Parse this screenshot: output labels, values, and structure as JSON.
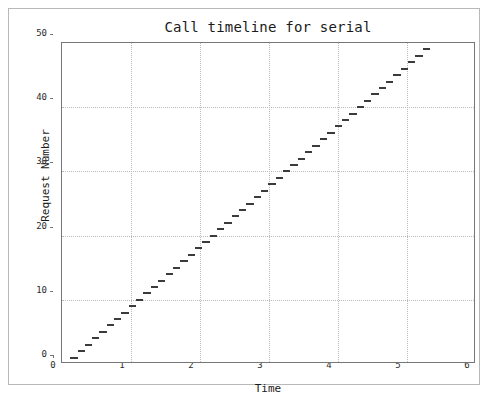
{
  "chart_data": {
    "type": "bar",
    "orientation": "horizontal-broken-barh",
    "title": "Call timeline for serial",
    "xlabel": "Time",
    "ylabel": "Request Number",
    "xlim": [
      0,
      6
    ],
    "ylim": [
      0,
      50
    ],
    "xticks": [
      0,
      1,
      2,
      3,
      4,
      5,
      6
    ],
    "yticks": [
      0,
      10,
      20,
      30,
      40,
      50
    ],
    "xtick_labels": [
      "0",
      "1",
      "2",
      "3",
      "4",
      "5",
      "6"
    ],
    "ytick_labels": [
      "0",
      "10",
      "20",
      "30",
      "40",
      "50"
    ],
    "grid": true,
    "grid_style": "dotted",
    "legend": "none",
    "bar_color": "#3b3b3b",
    "series": [
      {
        "name": "request spans",
        "note": "Each entry is one request: y = request number, x_start and x_end are the call start and end times.",
        "bars": [
          {
            "request": 1,
            "x_start": 0.12,
            "x_end": 0.23
          },
          {
            "request": 2,
            "x_start": 0.23,
            "x_end": 0.33
          },
          {
            "request": 3,
            "x_start": 0.33,
            "x_end": 0.44
          },
          {
            "request": 4,
            "x_start": 0.44,
            "x_end": 0.54
          },
          {
            "request": 5,
            "x_start": 0.54,
            "x_end": 0.65
          },
          {
            "request": 6,
            "x_start": 0.65,
            "x_end": 0.76
          },
          {
            "request": 7,
            "x_start": 0.76,
            "x_end": 0.86
          },
          {
            "request": 8,
            "x_start": 0.86,
            "x_end": 0.97
          },
          {
            "request": 9,
            "x_start": 0.97,
            "x_end": 1.07
          },
          {
            "request": 10,
            "x_start": 1.07,
            "x_end": 1.18
          },
          {
            "request": 11,
            "x_start": 1.18,
            "x_end": 1.29
          },
          {
            "request": 12,
            "x_start": 1.29,
            "x_end": 1.39
          },
          {
            "request": 13,
            "x_start": 1.39,
            "x_end": 1.5
          },
          {
            "request": 14,
            "x_start": 1.5,
            "x_end": 1.61
          },
          {
            "request": 15,
            "x_start": 1.61,
            "x_end": 1.71
          },
          {
            "request": 16,
            "x_start": 1.71,
            "x_end": 1.82
          },
          {
            "request": 17,
            "x_start": 1.82,
            "x_end": 1.93
          },
          {
            "request": 18,
            "x_start": 1.93,
            "x_end": 2.03
          },
          {
            "request": 19,
            "x_start": 2.03,
            "x_end": 2.14
          },
          {
            "request": 20,
            "x_start": 2.14,
            "x_end": 2.25
          },
          {
            "request": 21,
            "x_start": 2.25,
            "x_end": 2.35
          },
          {
            "request": 22,
            "x_start": 2.35,
            "x_end": 2.46
          },
          {
            "request": 23,
            "x_start": 2.46,
            "x_end": 2.57
          },
          {
            "request": 24,
            "x_start": 2.57,
            "x_end": 2.67
          },
          {
            "request": 25,
            "x_start": 2.67,
            "x_end": 2.78
          },
          {
            "request": 26,
            "x_start": 2.78,
            "x_end": 2.88
          },
          {
            "request": 27,
            "x_start": 2.88,
            "x_end": 2.99
          },
          {
            "request": 28,
            "x_start": 2.99,
            "x_end": 3.1
          },
          {
            "request": 29,
            "x_start": 3.1,
            "x_end": 3.2
          },
          {
            "request": 30,
            "x_start": 3.2,
            "x_end": 3.31
          },
          {
            "request": 31,
            "x_start": 3.31,
            "x_end": 3.42
          },
          {
            "request": 32,
            "x_start": 3.42,
            "x_end": 3.52
          },
          {
            "request": 33,
            "x_start": 3.52,
            "x_end": 3.63
          },
          {
            "request": 34,
            "x_start": 3.63,
            "x_end": 3.74
          },
          {
            "request": 35,
            "x_start": 3.74,
            "x_end": 3.84
          },
          {
            "request": 36,
            "x_start": 3.84,
            "x_end": 3.95
          },
          {
            "request": 37,
            "x_start": 3.95,
            "x_end": 4.06
          },
          {
            "request": 38,
            "x_start": 4.06,
            "x_end": 4.16
          },
          {
            "request": 39,
            "x_start": 4.16,
            "x_end": 4.27
          },
          {
            "request": 40,
            "x_start": 4.27,
            "x_end": 4.37
          },
          {
            "request": 41,
            "x_start": 4.37,
            "x_end": 4.48
          },
          {
            "request": 42,
            "x_start": 4.48,
            "x_end": 4.59
          },
          {
            "request": 43,
            "x_start": 4.59,
            "x_end": 4.69
          },
          {
            "request": 44,
            "x_start": 4.69,
            "x_end": 4.8
          },
          {
            "request": 45,
            "x_start": 4.8,
            "x_end": 4.91
          },
          {
            "request": 46,
            "x_start": 4.91,
            "x_end": 5.01
          },
          {
            "request": 47,
            "x_start": 5.01,
            "x_end": 5.12
          },
          {
            "request": 48,
            "x_start": 5.12,
            "x_end": 5.23
          },
          {
            "request": 49,
            "x_start": 5.23,
            "x_end": 5.33
          }
        ]
      }
    ]
  }
}
